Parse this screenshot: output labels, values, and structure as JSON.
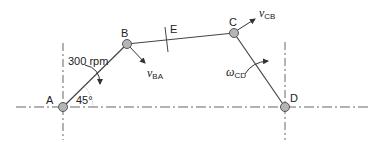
{
  "diagram": {
    "type": "four-bar linkage",
    "points": {
      "A": {
        "label": "A",
        "x": 63,
        "y": 107
      },
      "B": {
        "label": "B",
        "x": 127,
        "y": 44
      },
      "C": {
        "label": "C",
        "x": 234,
        "y": 33
      },
      "D": {
        "label": "D",
        "x": 285,
        "y": 107
      },
      "E": {
        "label": "E",
        "x": 166,
        "y": 39
      }
    },
    "annotations": {
      "speed": "300 rpm",
      "angle": "45°",
      "v_ba_main": "v",
      "v_ba_sub": "BA",
      "v_cb_main": "v",
      "v_cb_sub": "CB",
      "omega_cd_main": "ω",
      "omega_cd_sub": "CD"
    },
    "colors": {
      "line": "#444444",
      "joint_fill": "#b5b5b5",
      "joint_stroke": "#555555",
      "centerline": "#666666"
    }
  }
}
